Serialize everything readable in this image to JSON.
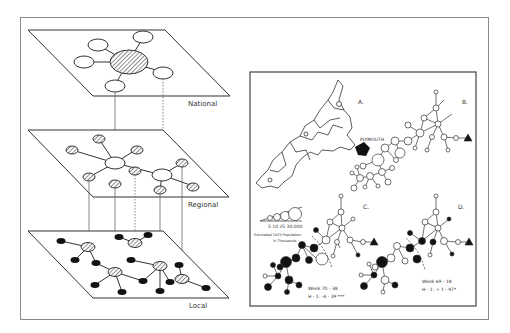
{
  "figure": {
    "left_panel": {
      "title": "Hierarchical network levels",
      "levels": [
        {
          "label": "National"
        },
        {
          "label": "Regional"
        },
        {
          "label": "Local"
        }
      ]
    },
    "right_panel": {
      "panels": {
        "a": "A.",
        "b": "B.",
        "c": "C.",
        "d": "D."
      },
      "city_label": "PLYMOUTH",
      "legend": {
        "scale_values": "5  10  25  30,000",
        "caption_line1": "Estimated 1970 Population",
        "caption_line2": "in Thousands"
      },
      "stats_c": {
        "line1": "Week  70 - 38",
        "line2": "H - 1:  -4 - 39 ***"
      },
      "stats_d": {
        "line1": "Week 69 - 18",
        "line2": "H - 1:  + 1 - 97*"
      }
    }
  }
}
